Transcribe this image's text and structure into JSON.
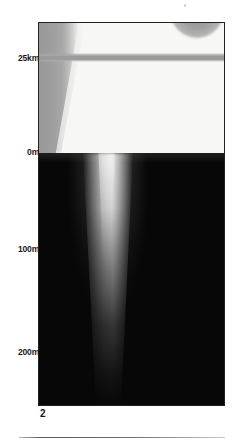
{
  "figure": {
    "panel_number": "2",
    "axis": {
      "label_unit_upper": "km",
      "label_unit_lower": "m",
      "ticks": [
        {
          "id": "tick-25km",
          "label": "25km",
          "value": 25,
          "unit": "km",
          "y_px": 58
        },
        {
          "id": "tick-0m",
          "label": "0m",
          "value": 0,
          "unit": "m",
          "y_px": 152
        },
        {
          "id": "tick-100m",
          "label": "100m",
          "value": 100,
          "unit": "m",
          "y_px": 249
        },
        {
          "id": "tick-200m",
          "label": "200m",
          "value": 200,
          "unit": "m",
          "y_px": 352
        }
      ]
    },
    "colors": {
      "upper_background": "#f7f7f5",
      "lower_background": "#070707",
      "band": "#9b9b9b",
      "wedge": "#9a9a9a",
      "border": "#222222",
      "text": "#1a1a1a",
      "rule": "#6e6e6e"
    },
    "features": [
      {
        "name": "left-grey-wedge",
        "description": "grey wedge along left edge of upper zone, narrowing downward"
      },
      {
        "name": "horizontal-grey-band",
        "description": "grey horizontal band spanning panel width at the 25km level"
      },
      {
        "name": "top-grey-blob",
        "description": "grey semicircular blob hanging below the top border"
      },
      {
        "name": "bright-plume",
        "description": "bright vertical plume in dark lower zone, narrowing with depth"
      },
      {
        "name": "marker-square",
        "description": "small square marker at the 25km tick on the panel edge"
      }
    ]
  }
}
